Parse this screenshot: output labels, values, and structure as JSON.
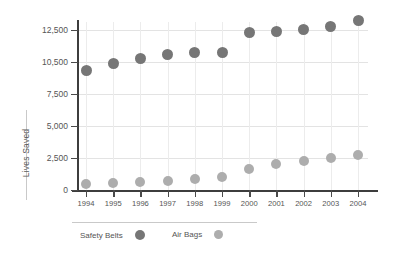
{
  "chart_data": {
    "type": "scatter",
    "title": "",
    "subtitle": "",
    "xlabel": "",
    "ylabel": "Lives Saved",
    "categories": [
      "1994",
      "1995",
      "1996",
      "1997",
      "1998",
      "1999",
      "2000",
      "2001",
      "2002",
      "2003",
      "2004"
    ],
    "x": [
      1994,
      1995,
      1996,
      1997,
      1998,
      1999,
      2000,
      2001,
      2002,
      2003,
      2004
    ],
    "series": [
      {
        "name": "Safety Belts",
        "color": "#767676",
        "marker": "circle",
        "values": [
          9700,
          10350,
          10700,
          10950,
          11100,
          11100,
          12350,
          12400,
          12550,
          12700,
          13100
        ]
      },
      {
        "name": "Air Bags",
        "color": "#adadad",
        "marker": "circle",
        "values": [
          500,
          550,
          650,
          700,
          850,
          1050,
          1650,
          2050,
          2250,
          2500,
          2700
        ]
      }
    ],
    "y_ticks": [
      0,
      2500,
      5000,
      7500,
      10500,
      12500
    ],
    "y_tick_labels": [
      "0",
      "2,500",
      "5,000",
      "7,500",
      "10,500",
      "12,500"
    ],
    "ylim": [
      0,
      13600
    ],
    "xlim": [
      1993.5,
      2004.5
    ],
    "grid": true,
    "grid_axis": "both",
    "legend_position": "bottom-left",
    "legend_entries": [
      "Safety Belts",
      "Air Bags"
    ]
  },
  "axis": {
    "y_title": "Lives Saved"
  },
  "legend": {
    "entries": [
      {
        "label": "Safety Belts"
      },
      {
        "label": "Air Bags"
      }
    ]
  },
  "colors": {
    "safety_belts": "#767676",
    "air_bags": "#adadad",
    "axis": "#3d3d3d",
    "grid": "#e3e3e3",
    "text": "#555555",
    "background": "#ffffff"
  }
}
